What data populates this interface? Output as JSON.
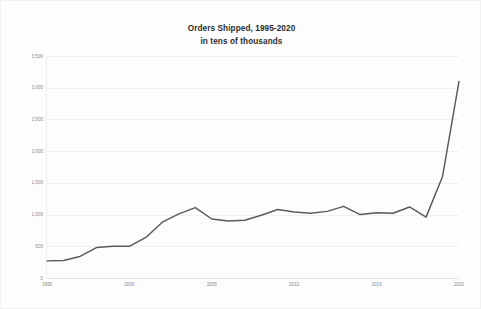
{
  "chart_data": {
    "type": "line",
    "title": "Orders Shipped, 1995-2020",
    "subtitle": "in tens of thousands",
    "xlabel": "",
    "ylabel": "",
    "grid": true,
    "legend": false,
    "line_color": "#5a5a5a",
    "background_color": "#fdfdfd",
    "xlim": [
      1995,
      2020
    ],
    "ylim": [
      0,
      3500
    ],
    "y_ticks": [
      0,
      500,
      1000,
      1500,
      2000,
      2500,
      3000,
      3500
    ],
    "y_tick_labels": [
      "0",
      "500",
      "1,000",
      "1,500",
      "2,000",
      "2,500",
      "3,000",
      "3,500"
    ],
    "x_ticks": [
      1995,
      2000,
      2005,
      2010,
      2015,
      2020
    ],
    "x_tick_labels": [
      "1995",
      "2000",
      "2005",
      "2010",
      "2015",
      "2020"
    ],
    "x": [
      1995,
      1996,
      1997,
      1998,
      1999,
      2000,
      2001,
      2002,
      2003,
      2004,
      2005,
      2006,
      2007,
      2008,
      2009,
      2010,
      2011,
      2012,
      2013,
      2014,
      2015,
      2016,
      2017,
      2018,
      2019,
      2020
    ],
    "values": [
      270,
      275,
      340,
      480,
      500,
      500,
      640,
      880,
      1010,
      1110,
      930,
      900,
      910,
      990,
      1080,
      1040,
      1020,
      1050,
      1130,
      1000,
      1030,
      1020,
      1120,
      960,
      1600,
      3100
    ],
    "series": [
      {
        "name": "Orders Shipped",
        "values": [
          270,
          275,
          340,
          480,
          500,
          500,
          640,
          880,
          1010,
          1110,
          930,
          900,
          910,
          990,
          1080,
          1040,
          1020,
          1050,
          1130,
          1000,
          1030,
          1020,
          1120,
          960,
          1600,
          3100
        ]
      }
    ]
  }
}
